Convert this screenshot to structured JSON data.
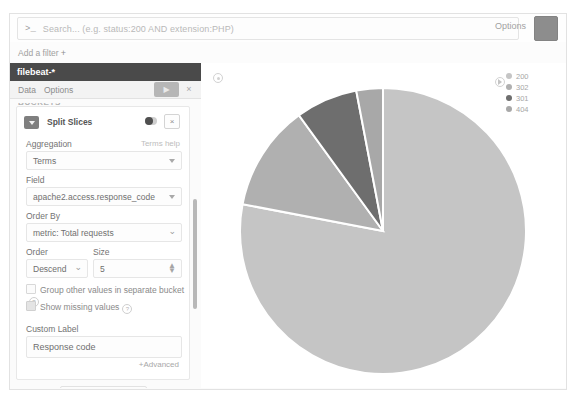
{
  "query_bar": {
    "prompt_glyph": ">_",
    "placeholder": "Search... (e.g. status:200 AND extension:PHP)",
    "options_label": "Options",
    "search_button_name": "search-button"
  },
  "filter_bar": {
    "add_filter_label": "Add a filter",
    "plus_glyph": "+"
  },
  "editor_panel": {
    "index_pattern_title": "filebeat-*",
    "tabs": [
      {
        "label": "Data"
      },
      {
        "label": "Options"
      }
    ],
    "apply_label": "▶",
    "close_label": "×",
    "section_label": "BUCKETS",
    "bucket": {
      "title": "Split Slices",
      "remove_label": "×",
      "aggregation_label": "Aggregation",
      "aggregation_help": "Terms help",
      "aggregation_value": "Terms",
      "field_label": "Field",
      "field_value": "apache2.access.response_code",
      "order_by_label": "Order By",
      "order_by_value": "metric: Total requests",
      "order_label": "Order",
      "order_value": "Descend",
      "size_label": "Size",
      "size_value": "5",
      "group_other_label": "Group other values in separate bucket",
      "show_missing_label": "Show missing values",
      "help_glyph": "?",
      "custom_label_label": "Custom Label",
      "custom_label_value": "Response code",
      "advanced_label": "+Advanced",
      "add_sub_buckets_label": "Add sub-buckets"
    }
  },
  "chart_data": {
    "type": "pie",
    "title": "",
    "legend_position": "right",
    "labels": [
      "200",
      "302",
      "301",
      "404"
    ],
    "values": [
      78,
      12,
      7,
      3
    ],
    "colors": [
      "#c5c5c5",
      "#b0b0b0",
      "#6e6e6e",
      "#a8a8a8"
    ],
    "slice_border": "#ffffff",
    "legend": [
      {
        "label": "200",
        "color": "#c5c5c5"
      },
      {
        "label": "302",
        "color": "#b0b0b0"
      },
      {
        "label": "301",
        "color": "#6e6e6e"
      },
      {
        "label": "404",
        "color": "#a8a8a8"
      }
    ]
  }
}
